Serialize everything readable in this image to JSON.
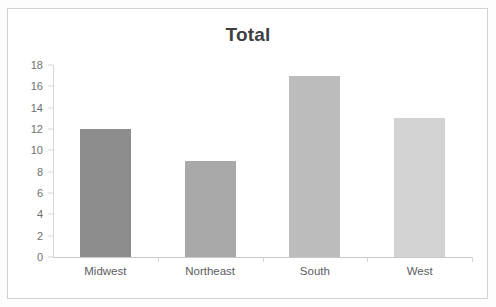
{
  "chart_data": {
    "type": "bar",
    "title": "Total",
    "xlabel": "",
    "ylabel": "",
    "categories": [
      "Midwest",
      "Northeast",
      "South",
      "West"
    ],
    "values": [
      12,
      9,
      17,
      13
    ],
    "ylim": [
      0,
      18
    ],
    "ytick_step": 2,
    "yticks": [
      "18",
      "16",
      "14",
      "12",
      "10",
      "8",
      "6",
      "4",
      "2",
      "0"
    ],
    "grid": false,
    "legend": "none",
    "bar_colors": [
      "#8d8d8d",
      "#a9a9a9",
      "#bcbcbc",
      "#d2d2d2"
    ]
  },
  "style": {
    "title_color": "#3f3f3f",
    "axis_label_color": "#5d5d5d",
    "tick_label_color": "#6f6f6f",
    "axis_line_color": "#d6d6d6",
    "baseline_color": "#c9c9c9",
    "border_color": "#d2d2d2",
    "plot_background": "#ffffff",
    "page_background": "#fdfdfd"
  }
}
